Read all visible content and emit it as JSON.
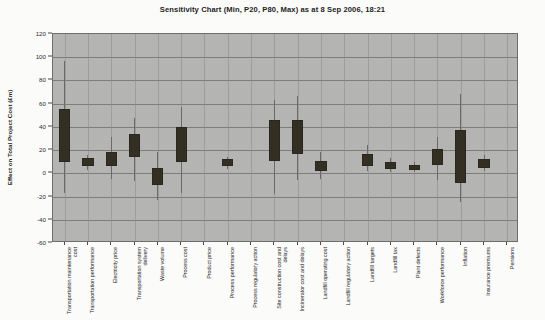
{
  "chart_data": {
    "type": "bar",
    "title": "Sensitivity Chart (Min, P20, P80, Max) as at 8 Sep 2006, 18:21",
    "xlabel": "",
    "ylabel": "Effect on Total Project Cost (£m)",
    "ylim": [
      -60,
      120
    ],
    "ytick_step": 20,
    "yticks": [
      120,
      100,
      80,
      60,
      40,
      20,
      0,
      -20,
      -40,
      -60
    ],
    "ytick_labels": [
      "120",
      "100",
      "80",
      "60",
      "40",
      "20",
      "0",
      "-20",
      "-40",
      "-60"
    ],
    "grid": true,
    "legend": "none",
    "series_names": [
      "Min",
      "P20",
      "P80",
      "Max"
    ],
    "categories": [
      "Transportation maintenance cost",
      "Transportation performance",
      "Electricity price",
      "Transportation system delivery",
      "Waste volume",
      "Process cost",
      "Product price",
      "Process performance",
      "Process regulatory action",
      "Site construction cost and delays",
      "Incinerator cost and delays",
      "Landfill operating cost",
      "Landfill regulatory action",
      "Landfill targets",
      "Landfill tax",
      "Plant defects",
      "Workforce performance",
      "Inflation",
      "Insurance premiums",
      "Pensions"
    ],
    "points": [
      {
        "category": "Transportation maintenance cost",
        "min": -17,
        "p20": 10,
        "p80": 55,
        "max": 97
      },
      {
        "category": "Transportation performance",
        "min": 3,
        "p20": 6,
        "p80": 13,
        "max": 16
      },
      {
        "category": "Electricity price",
        "min": -5,
        "p20": 6,
        "p80": 18,
        "max": 31
      },
      {
        "category": "Transportation system delivery",
        "min": -7,
        "p20": 14,
        "p80": 34,
        "max": 48
      },
      {
        "category": "Waste volume",
        "min": -23,
        "p20": -10,
        "p80": 5,
        "max": 18
      },
      {
        "category": "Process cost",
        "min": -17,
        "p20": 10,
        "p80": 40,
        "max": 57
      },
      {
        "category": "Product price",
        "min": 0,
        "p20": 0,
        "p80": 0,
        "max": 0
      },
      {
        "category": "Process performance",
        "min": 4,
        "p20": 6,
        "p80": 12,
        "max": 14
      },
      {
        "category": "Process regulatory action",
        "min": 0,
        "p20": 0,
        "p80": 0,
        "max": 0
      },
      {
        "category": "Site construction cost and delays",
        "min": -18,
        "p20": 11,
        "p80": 46,
        "max": 63
      },
      {
        "category": "Incinerator cost and delays",
        "min": -6,
        "p20": 17,
        "p80": 46,
        "max": 67
      },
      {
        "category": "Landfill operating cost",
        "min": -5,
        "p20": 2,
        "p80": 11,
        "max": 18
      },
      {
        "category": "Landfill regulatory action",
        "min": 0,
        "p20": 0,
        "p80": 0,
        "max": 0
      },
      {
        "category": "Landfill targets",
        "min": 2,
        "p20": 6,
        "p80": 17,
        "max": 24
      },
      {
        "category": "Landfill tax",
        "min": 1,
        "p20": 4,
        "p80": 10,
        "max": 13
      },
      {
        "category": "Plant defects",
        "min": 1,
        "p20": 3,
        "p80": 7,
        "max": 10
      },
      {
        "category": "Workforce performance",
        "min": -6,
        "p20": 7,
        "p80": 21,
        "max": 31
      },
      {
        "category": "Inflation",
        "min": -25,
        "p20": -8,
        "p80": 37,
        "max": 68
      },
      {
        "category": "Insurance premiums",
        "min": 2,
        "p20": 5,
        "p80": 12,
        "max": 16
      },
      {
        "category": "Pensions",
        "min": 0,
        "p20": 0,
        "p80": 0,
        "max": 0
      }
    ]
  },
  "colors": {
    "plot_background": "#b4b4b2",
    "gridline": "#7d7d7b",
    "box_fill": "#332f23",
    "whisker": "#6a6a68",
    "page_background": "#fbfbfa",
    "text": "#2b2b2b"
  }
}
